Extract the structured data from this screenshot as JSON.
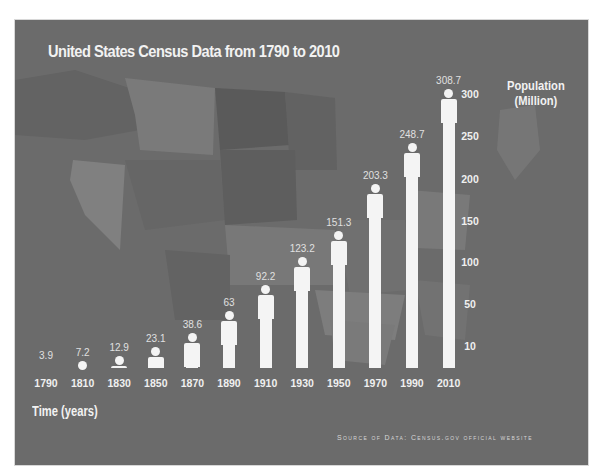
{
  "chart_data": {
    "type": "bar",
    "title": "United States Census Data from 1790 to 2010",
    "xlabel": "Time (years)",
    "ylabel": "Population (Million)",
    "categories": [
      "1790",
      "1810",
      "1830",
      "1850",
      "1870",
      "1890",
      "1910",
      "1930",
      "1950",
      "1970",
      "1990",
      "2010"
    ],
    "values": [
      3.9,
      7.2,
      12.9,
      23.1,
      38.6,
      63,
      92.2,
      123.2,
      151.3,
      203.3,
      248.7,
      308.7
    ],
    "value_labels": [
      "3.9",
      "7.2",
      "12.9",
      "23.1",
      "38.6",
      "63",
      "92.2",
      "123.2",
      "151.3",
      "203.3",
      "248.7",
      "308.7"
    ],
    "y_ticks": [
      "300",
      "250",
      "200",
      "150",
      "100",
      "50",
      "10"
    ],
    "ylim": [
      0,
      320
    ],
    "grid": false,
    "legend": null,
    "bar_style": "person pictogram bars (white)",
    "axis_position": "y-axis labels on right",
    "annotation": "Source of Data: Census.gov official website",
    "background": "United States map silhouette, gray tones"
  },
  "colors": {
    "panel_bg": "#6b6b6b",
    "bar": "#f4f4f4",
    "text": "#f2f2f2"
  }
}
